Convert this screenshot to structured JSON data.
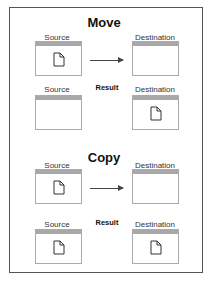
{
  "sections": [
    {
      "title": "Move",
      "source": "Source",
      "destination": "Destination",
      "result": "Result",
      "before": {
        "source_has_file": true,
        "dest_has_file": false
      },
      "after": {
        "source_has_file": false,
        "dest_has_file": true
      }
    },
    {
      "title": "Copy",
      "source": "Source",
      "destination": "Destination",
      "result": "Result",
      "before": {
        "source_has_file": true,
        "dest_has_file": false
      },
      "after": {
        "source_has_file": true,
        "dest_has_file": true
      }
    }
  ]
}
